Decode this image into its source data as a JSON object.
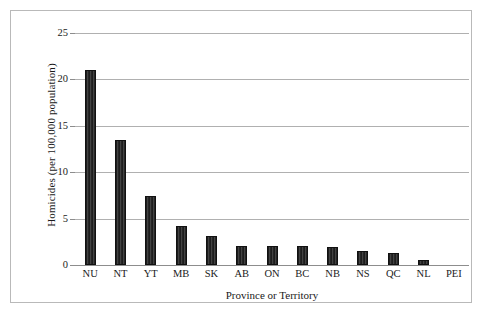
{
  "chart_data": {
    "type": "bar",
    "title": "",
    "xlabel": "Province or Territory",
    "ylabel": "Homicides (per 100,000 population)",
    "categories": [
      "NU",
      "NT",
      "YT",
      "MB",
      "SK",
      "AB",
      "ON",
      "BC",
      "NB",
      "NS",
      "QC",
      "NL",
      "PEI"
    ],
    "values": [
      21.0,
      13.5,
      7.4,
      4.2,
      3.1,
      2.0,
      2.0,
      2.0,
      1.9,
      1.5,
      1.3,
      0.5,
      0.0
    ],
    "ylim": [
      0,
      25
    ],
    "ytick_labels": [
      "0",
      "5",
      "10",
      "15",
      "20",
      "25"
    ],
    "ytick_values": [
      0,
      5,
      10,
      15,
      20,
      25
    ],
    "grid": "horizontal",
    "legend": "none",
    "bar_color": "#2b2b2b",
    "gridline_color": "#b0b0b0",
    "axis_color": "#8d8d8d",
    "border_color": "#b9b9b9",
    "background": "#ffffff"
  }
}
